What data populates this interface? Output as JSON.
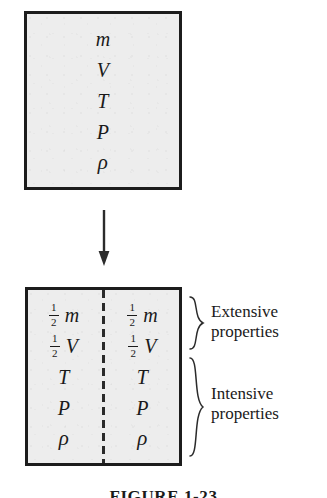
{
  "figure": {
    "caption": "FIGURE 1-23",
    "colors": {
      "box_fill": "#ededed",
      "box_border": "#1c1c1c",
      "divider": "#2a2a2a",
      "text": "#1a1a1a"
    }
  },
  "top_system": {
    "name": "whole-system-box",
    "properties": [
      {
        "coefficient": "",
        "symbol": "m"
      },
      {
        "coefficient": "",
        "symbol": "V"
      },
      {
        "coefficient": "",
        "symbol": "T"
      },
      {
        "coefficient": "",
        "symbol": "P"
      },
      {
        "coefficient": "",
        "symbol": "ρ"
      }
    ]
  },
  "arrow": {
    "name": "division-arrow",
    "direction": "down"
  },
  "bottom_system": {
    "name": "divided-system-box",
    "divider": "dashed-vertical-line",
    "left_half": {
      "properties": [
        {
          "fraction_num": "1",
          "fraction_den": "2",
          "symbol": "m"
        },
        {
          "fraction_num": "1",
          "fraction_den": "2",
          "symbol": "V"
        },
        {
          "fraction_num": "",
          "fraction_den": "",
          "symbol": "T"
        },
        {
          "fraction_num": "",
          "fraction_den": "",
          "symbol": "P"
        },
        {
          "fraction_num": "",
          "fraction_den": "",
          "symbol": "ρ"
        }
      ]
    },
    "right_half": {
      "properties": [
        {
          "fraction_num": "1",
          "fraction_den": "2",
          "symbol": "m"
        },
        {
          "fraction_num": "1",
          "fraction_den": "2",
          "symbol": "V"
        },
        {
          "fraction_num": "",
          "fraction_den": "",
          "symbol": "T"
        },
        {
          "fraction_num": "",
          "fraction_den": "",
          "symbol": "P"
        },
        {
          "fraction_num": "",
          "fraction_den": "",
          "symbol": "ρ"
        }
      ]
    }
  },
  "annotations": {
    "extensive": {
      "line1": "Extensive",
      "line2": "properties"
    },
    "intensive": {
      "line1": "Intensive",
      "line2": "properties"
    }
  }
}
